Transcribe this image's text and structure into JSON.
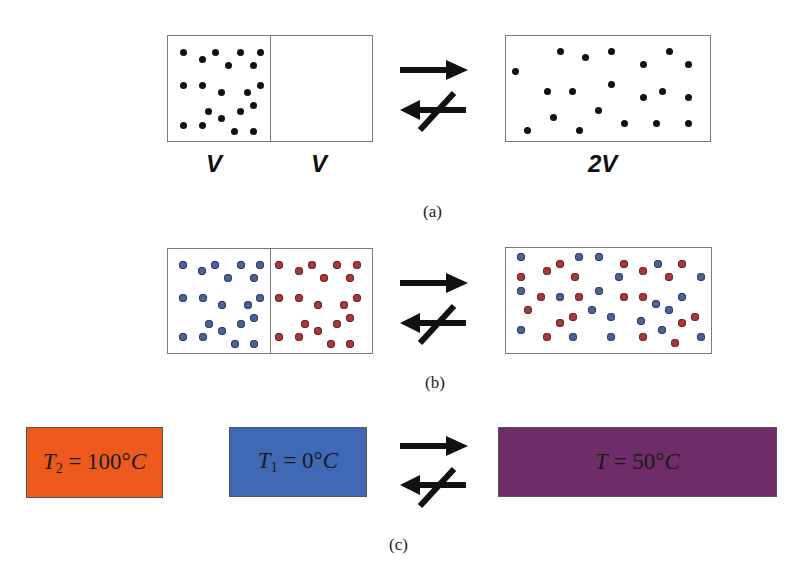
{
  "colors": {
    "box_border": "#7a7a7a",
    "black_dot": "#111111",
    "blue_dot": "#4d6299",
    "red_dot": "#a53b3b",
    "hot": "#ee5a1e",
    "cold": "#3f68b5",
    "mixed": "#6e2d68"
  },
  "panel_a": {
    "caption": "(a)",
    "label_left": "V",
    "label_right": "V",
    "label_result": "2V",
    "left_dots": [
      [
        183,
        52
      ],
      [
        202,
        59
      ],
      [
        215,
        52
      ],
      [
        240,
        52
      ],
      [
        260,
        52
      ],
      [
        228,
        65
      ],
      [
        253,
        65
      ],
      [
        183,
        85
      ],
      [
        202,
        85
      ],
      [
        221,
        92
      ],
      [
        247,
        92
      ],
      [
        260,
        85
      ],
      [
        208,
        111
      ],
      [
        240,
        111
      ],
      [
        253,
        105
      ],
      [
        221,
        118
      ],
      [
        183,
        125
      ],
      [
        202,
        125
      ],
      [
        234,
        131
      ],
      [
        253,
        131
      ]
    ],
    "right_dots": [
      [
        515,
        71
      ],
      [
        560,
        51
      ],
      [
        585,
        57
      ],
      [
        611,
        51
      ],
      [
        643,
        64
      ],
      [
        669,
        51
      ],
      [
        688,
        64
      ],
      [
        547,
        91
      ],
      [
        572,
        91
      ],
      [
        611,
        84
      ],
      [
        643,
        97
      ],
      [
        662,
        91
      ],
      [
        688,
        97
      ],
      [
        598,
        110
      ],
      [
        553,
        117
      ],
      [
        527,
        130
      ],
      [
        579,
        130
      ],
      [
        624,
        123
      ],
      [
        656,
        123
      ],
      [
        688,
        123
      ]
    ]
  },
  "panel_b": {
    "caption": "(b)",
    "left_blue": [
      [
        183,
        265
      ],
      [
        202,
        271
      ],
      [
        215,
        265
      ],
      [
        241,
        265
      ],
      [
        260,
        265
      ],
      [
        228,
        278
      ],
      [
        254,
        278
      ],
      [
        183,
        298
      ],
      [
        203,
        298
      ],
      [
        222,
        305
      ],
      [
        248,
        305
      ],
      [
        260,
        298
      ],
      [
        209,
        324
      ],
      [
        241,
        324
      ],
      [
        254,
        318
      ],
      [
        222,
        331
      ],
      [
        183,
        337
      ],
      [
        203,
        337
      ],
      [
        235,
        344
      ],
      [
        254,
        344
      ]
    ],
    "left_red": [
      [
        279,
        265
      ],
      [
        299,
        271
      ],
      [
        312,
        265
      ],
      [
        337,
        265
      ],
      [
        357,
        265
      ],
      [
        324,
        278
      ],
      [
        350,
        278
      ],
      [
        279,
        298
      ],
      [
        299,
        298
      ],
      [
        318,
        305
      ],
      [
        344,
        305
      ],
      [
        357,
        298
      ],
      [
        305,
        324
      ],
      [
        337,
        324
      ],
      [
        350,
        318
      ],
      [
        318,
        331
      ],
      [
        279,
        337
      ],
      [
        299,
        337
      ],
      [
        331,
        344
      ],
      [
        350,
        344
      ]
    ],
    "right_blue": [
      [
        521,
        257
      ],
      [
        579,
        257
      ],
      [
        599,
        257
      ],
      [
        658,
        264
      ],
      [
        619,
        277
      ],
      [
        701,
        277
      ],
      [
        521,
        291
      ],
      [
        560,
        297
      ],
      [
        599,
        291
      ],
      [
        656,
        304
      ],
      [
        682,
        297
      ],
      [
        592,
        310
      ],
      [
        669,
        310
      ],
      [
        611,
        317
      ],
      [
        641,
        321
      ],
      [
        521,
        330
      ],
      [
        662,
        330
      ],
      [
        573,
        337
      ],
      [
        611,
        337
      ],
      [
        701,
        337
      ]
    ],
    "right_red": [
      [
        560,
        264
      ],
      [
        547,
        271
      ],
      [
        521,
        277
      ],
      [
        575,
        277
      ],
      [
        624,
        264
      ],
      [
        643,
        271
      ],
      [
        682,
        264
      ],
      [
        669,
        277
      ],
      [
        541,
        297
      ],
      [
        579,
        297
      ],
      [
        624,
        297
      ],
      [
        643,
        297
      ],
      [
        528,
        310
      ],
      [
        573,
        317
      ],
      [
        560,
        323
      ],
      [
        682,
        323
      ],
      [
        695,
        317
      ],
      [
        547,
        337
      ],
      [
        643,
        337
      ],
      [
        675,
        343
      ]
    ]
  },
  "panel_c": {
    "caption": "(c)",
    "hot": {
      "var": "T",
      "sub": "2",
      "rest": " = 100°",
      "unit": "C"
    },
    "cold": {
      "var": "T",
      "sub": "1",
      "rest": " = 0°",
      "unit": "C"
    },
    "mixed": {
      "var": "T",
      "sub": "",
      "rest": " = 50°",
      "unit": "C"
    }
  },
  "arrows": {
    "forward": "→",
    "reverse_blocked": "↚"
  }
}
